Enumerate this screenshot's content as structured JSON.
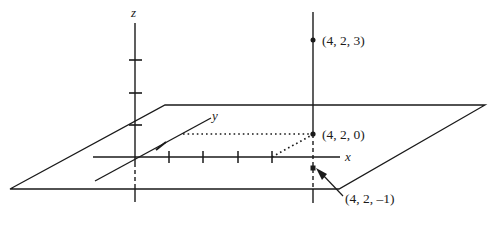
{
  "figure": {
    "type": "3d-coordinate-axes-diagram",
    "background_color": "#ffffff",
    "stroke_color": "#1a1a1a",
    "axes": [
      {
        "name": "x",
        "label": "x",
        "label_x": 345,
        "label_y": 161
      },
      {
        "name": "y",
        "label": "y",
        "label_x": 212,
        "label_y": 120
      },
      {
        "name": "z",
        "label": "z",
        "label_x": 133,
        "label_y": 17
      }
    ],
    "points": [
      {
        "name": "point-4-2-3",
        "label": "(4, 2, 3)",
        "coords": [
          4,
          2,
          3
        ],
        "px": 313,
        "py": 40,
        "label_x": 322,
        "label_y": 45
      },
      {
        "name": "point-4-2-0",
        "label": "(4, 2, 0)",
        "coords": [
          4,
          2,
          0
        ],
        "px": 313,
        "py": 134,
        "label_x": 322,
        "label_y": 139
      },
      {
        "name": "point-4-2-neg1",
        "label": "(4, 2, –1)",
        "coords": [
          4,
          2,
          -1
        ],
        "px": 313,
        "py": 168,
        "label_x": 345,
        "label_y": 203
      }
    ],
    "plane": {
      "name": "xy-plane-parallelogram",
      "vertices": "10,189 165,105 485,105 339,189"
    },
    "origin": {
      "x": 135,
      "y": 157
    },
    "x_axis": {
      "x1": 93,
      "y1": 157,
      "x2": 340,
      "y2": 157,
      "ticks": [
        169,
        203,
        238,
        272
      ]
    },
    "y_axis": {
      "x1": 95,
      "y1": 181,
      "x2": 211,
      "y2": 118,
      "tick_x": 161,
      "tick_y": 146
    },
    "z_axis": {
      "x": 135,
      "y_top": 23,
      "y_bottom": 200,
      "ticks": [
        60,
        93,
        125
      ]
    },
    "vertical_line": {
      "x": 313,
      "y_top": 12,
      "y_plane": 134,
      "y_bottom_plane": 189,
      "y_bottom": 203
    },
    "dotted_guides": [
      {
        "name": "dotted-horizontal-to-point",
        "x1": 183,
        "y1": 134,
        "x2": 311,
        "y2": 134
      },
      {
        "name": "dotted-diagonal-to-x-axis",
        "x1": 272,
        "y1": 157,
        "x2": 311,
        "y2": 136
      }
    ],
    "arrow": {
      "name": "callout-arrow",
      "from_x": 342,
      "from_y": 195,
      "to_x": 318,
      "to_y": 172
    }
  }
}
